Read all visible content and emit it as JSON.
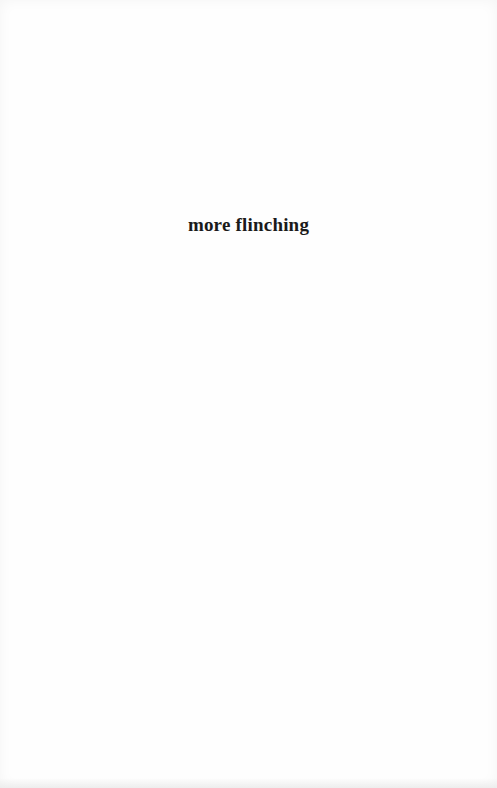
{
  "page": {
    "heading": "more flinching"
  }
}
